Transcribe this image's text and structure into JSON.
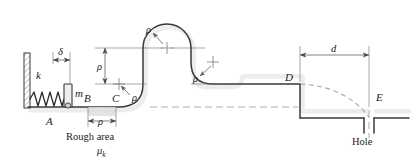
{
  "figure": {
    "background_color": "#ffffff",
    "line_color": "#3a3a3a",
    "dash_color": "#9a9a9a"
  },
  "labels": {
    "spring_constant": "k",
    "compression": "δ",
    "mass": "m",
    "point_a": "A",
    "point_b": "B",
    "point_c": "C",
    "point_d": "D",
    "point_e": "E",
    "radius_bc": "ρ",
    "radius_rise": "ρ",
    "radius_left_curve": "ρ",
    "radius_arch": "ρ",
    "radius_right_curve": "ρ",
    "distance_d": "d",
    "rough_area": "Rough area",
    "friction_mu": "μ",
    "friction_sub": "k",
    "hole": "Hole"
  }
}
